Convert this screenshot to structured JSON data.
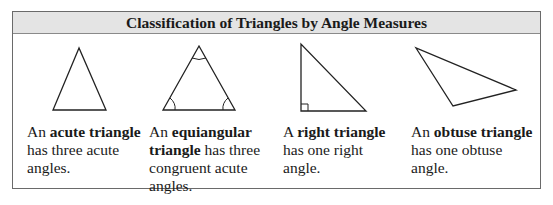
{
  "table": {
    "title": "Classification of Triangles by Angle Measures",
    "columns": [
      {
        "figure": "acute-triangle",
        "text_before": "An ",
        "term": "acute triangle",
        "text_after": " has three acute angles."
      },
      {
        "figure": "equiangular-triangle",
        "text_before": "An ",
        "term": "equiangular triangle",
        "text_after": " has three congruent acute angles."
      },
      {
        "figure": "right-triangle",
        "text_before": "A ",
        "term": "right triangle",
        "text_after": " has one right angle."
      },
      {
        "figure": "obtuse-triangle",
        "text_before": "An ",
        "term": "obtuse triangle",
        "text_after": " has one obtuse angle."
      }
    ]
  }
}
